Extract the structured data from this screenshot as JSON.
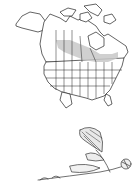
{
  "map": {
    "region": "North America",
    "range_color": "#c8c8c8",
    "border_color": "#222222",
    "range_description": "Shaded band across southern-central Canada (prairie provinces east to Ontario/Quebec)"
  },
  "illustration": {
    "subject": "plant sketch with leaves and stem",
    "stroke_color": "#333333"
  }
}
